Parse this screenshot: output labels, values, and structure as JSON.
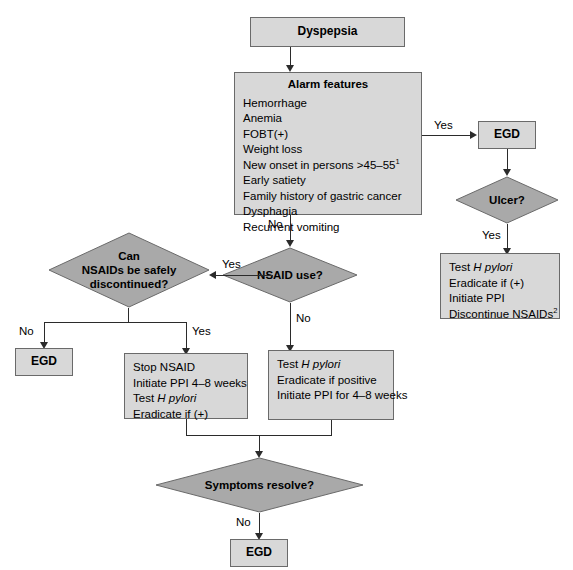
{
  "diagram": {
    "colors": {
      "box_fill": "#d8d8d8",
      "diamond_fill": "#a9a9a9",
      "stroke": "#6a6a6a",
      "connector": "#2b2b2b",
      "background": "#ffffff",
      "text": "#000000"
    }
  },
  "nodes": {
    "dyspepsia": {
      "label": "Dyspepsia",
      "shape": "box"
    },
    "alarm_features": {
      "title": "Alarm features",
      "shape": "box",
      "items": [
        "Hemorrhage",
        "Anemia",
        "FOBT(+)",
        "Weight loss",
        "New onset in persons >45–55",
        "Early satiety",
        "Family history of gastric cancer",
        "Dysphagia",
        "Recurrent vomiting"
      ],
      "new_onset_superscript": "1"
    },
    "egd_top": {
      "label": "EGD",
      "shape": "box"
    },
    "ulcer": {
      "label": "Ulcer?",
      "shape": "diamond"
    },
    "ulcer_treatment": {
      "shape": "box",
      "items": [
        "Test H pylori",
        "Eradicate if (+)",
        "Initiate PPI",
        "Discontinue NSAIDs"
      ],
      "italic_term": "H pylori",
      "discontinue_superscript": "2"
    },
    "nsaid_use": {
      "label": "NSAID use?",
      "shape": "diamond"
    },
    "can_discontinue": {
      "shape": "diamond",
      "line1": "Can",
      "line2": "NSAIDs be safely",
      "line3": "discontinued?"
    },
    "egd_left": {
      "label": "EGD",
      "shape": "box"
    },
    "stop_nsaid": {
      "shape": "box",
      "items": [
        "Stop NSAID",
        "Initiate PPI 4–8 weeks",
        "Test H pylori",
        "Eradicate if (+)"
      ],
      "italic_term": "H pylori"
    },
    "test_hpylori": {
      "shape": "box",
      "items": [
        "Test H pylori",
        "Eradicate if positive",
        "Initiate PPI for 4–8 weeks"
      ],
      "italic_term": "H pylori"
    },
    "symptoms_resolve": {
      "label": "Symptoms resolve?",
      "shape": "diamond"
    },
    "egd_bottom": {
      "label": "EGD",
      "shape": "box"
    }
  },
  "edge_labels": {
    "alarm_yes": "Yes",
    "alarm_no": "No",
    "ulcer_yes": "Yes",
    "nsaid_yes": "Yes",
    "nsaid_no": "No",
    "discontinue_no": "No",
    "discontinue_yes": "Yes",
    "symptoms_no": "No"
  }
}
